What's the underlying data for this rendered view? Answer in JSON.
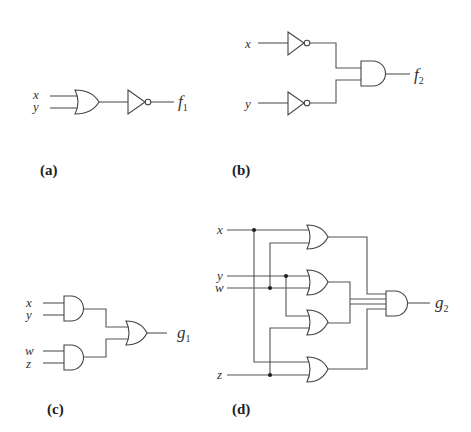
{
  "figure": {
    "panels": [
      {
        "id": "a",
        "caption": "(a)",
        "inputs": [
          "x",
          "y"
        ],
        "gates": [
          "OR",
          "NOT"
        ],
        "output": {
          "name": "f",
          "subscript": "1"
        }
      },
      {
        "id": "b",
        "caption": "(b)",
        "inputs": [
          "x",
          "y"
        ],
        "gates": [
          "NOT",
          "NOT",
          "AND"
        ],
        "output": {
          "name": "f",
          "subscript": "2"
        }
      },
      {
        "id": "c",
        "caption": "(c)",
        "inputs": [
          "x",
          "y",
          "w",
          "z"
        ],
        "gates": [
          "AND",
          "AND",
          "OR"
        ],
        "output": {
          "name": "g",
          "subscript": "1"
        }
      },
      {
        "id": "d",
        "caption": "(d)",
        "inputs": [
          "x",
          "y",
          "w",
          "z"
        ],
        "gates": [
          "OR",
          "OR",
          "OR",
          "OR",
          "AND"
        ],
        "output": {
          "name": "g",
          "subscript": "2"
        }
      }
    ]
  }
}
